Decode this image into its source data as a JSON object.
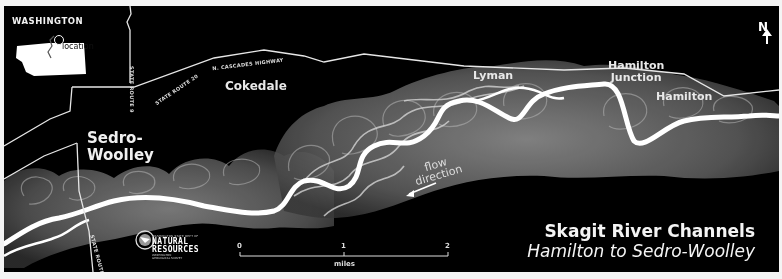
{
  "map": {
    "title": "Skagit River Channels",
    "subtitle": "Hamilton to Sedro-Woolley",
    "inset": {
      "state_label": "WASHINGTON",
      "location_label": "location"
    },
    "north_arrow": {
      "label": "N"
    },
    "towns": [
      {
        "name": "Sedro-",
        "name2": "Woolley"
      },
      {
        "name": "Cokedale"
      },
      {
        "name": "Lyman"
      },
      {
        "name": "Hamilton",
        "name2": "Junction"
      },
      {
        "name": "Hamilton"
      }
    ],
    "roads": {
      "highway": "N. CASCADES HIGHWAY",
      "route20": "STATE ROUTE 20",
      "route9_north": "STATE ROUTE 9",
      "route9_south": "STATE ROUTE 9"
    },
    "flow_label": {
      "line1": "flow",
      "line2": "direction"
    },
    "scale_bar": {
      "ticks": [
        "0",
        "1",
        "2"
      ],
      "unit": "miles"
    },
    "agency": {
      "top_line": "WASHINGTON STATE DEPT OF",
      "name1": "NATURAL",
      "name2": "RESOURCES",
      "sub1": "WASHINGTON",
      "sub2": "GEOLOGICAL SURVEY"
    },
    "colors": {
      "background": "#000000",
      "river": "#ffffff",
      "floodplain": "#8a8a8a",
      "roads": "#e6e6e6",
      "frame": "#f4f4f4"
    }
  }
}
